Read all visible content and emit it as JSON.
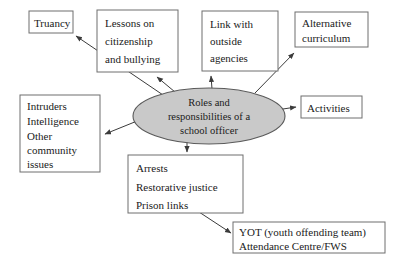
{
  "diagram": {
    "title": "Roles and responsibilities of a school officer",
    "type": "hub-and-spoke concept map",
    "colors": {
      "hub_fill": "#c9c9c9",
      "hub_stroke": "#5a5a5a",
      "box_fill": "#ffffff",
      "box_stroke": "#6e6e6e",
      "arrow": "#3b3b3b",
      "text": "#1a1a1a",
      "background": "#ffffff"
    },
    "hub": {
      "label_lines": [
        "Roles and",
        "responsibilities of a",
        "school officer"
      ],
      "line1": "Roles and",
      "line2": "responsibilities of a",
      "line3": "school officer"
    },
    "nodes": [
      {
        "id": "truancy",
        "lines": [
          "Truancy"
        ],
        "line1": "Truancy"
      },
      {
        "id": "lessons",
        "lines": [
          "Lessons on",
          "citizenship",
          "and bullying"
        ],
        "line1": "Lessons on",
        "line2": "citizenship",
        "line3": "and bullying"
      },
      {
        "id": "link-outside-agencies",
        "lines": [
          "Link with",
          "outside",
          "agencies"
        ],
        "line1": "Link with",
        "line2": "outside",
        "line3": "agencies"
      },
      {
        "id": "alternative-curriculum",
        "lines": [
          "Alternative",
          "curriculum"
        ],
        "line1": "Alternative",
        "line2": "curriculum"
      },
      {
        "id": "activities",
        "lines": [
          "Activities"
        ],
        "line1": "Activities"
      },
      {
        "id": "intruders",
        "lines": [
          "Intruders",
          "Intelligence",
          "Other",
          "community",
          "issues"
        ],
        "line1": "Intruders",
        "line2": "Intelligence",
        "line3": "Other",
        "line4": "community",
        "line5": "issues"
      },
      {
        "id": "arrests",
        "lines": [
          "Arrests",
          "Restorative justice",
          "Prison links"
        ],
        "line1": "Arrests",
        "line2": "Restorative justice",
        "line3": "Prison links"
      },
      {
        "id": "yot",
        "lines": [
          "YOT (youth offending team)",
          "Attendance Centre/FWS"
        ],
        "line1": "YOT (youth offending team)",
        "line2": "Attendance Centre/FWS"
      }
    ],
    "connections": [
      {
        "from": "hub",
        "to": "truancy"
      },
      {
        "from": "hub",
        "to": "lessons"
      },
      {
        "from": "hub",
        "to": "link-outside-agencies"
      },
      {
        "from": "hub",
        "to": "alternative-curriculum"
      },
      {
        "from": "hub",
        "to": "activities"
      },
      {
        "from": "hub",
        "to": "intruders"
      },
      {
        "from": "hub",
        "to": "arrests"
      },
      {
        "from": "arrests",
        "to": "yot"
      }
    ]
  }
}
